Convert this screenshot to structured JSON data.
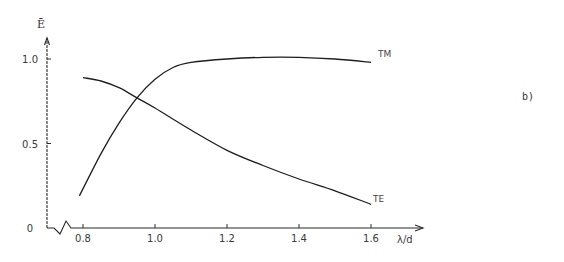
{
  "chart_data": {
    "type": "line",
    "title": "",
    "panel_label": "b)",
    "xlabel": "λ/d",
    "ylabel": "Ē",
    "xlim": [
      0.8,
      1.6
    ],
    "ylim": [
      0,
      1.0
    ],
    "x_axis_break": true,
    "grid": false,
    "x_ticks": [
      0.8,
      1.0,
      1.2,
      1.4,
      1.6
    ],
    "x_tick_labels": [
      "0.8",
      "1.0",
      "1.2",
      "1.4",
      "1.6"
    ],
    "y_ticks": [
      0,
      0.5,
      1.0
    ],
    "y_tick_labels": [
      "0",
      "0.5",
      "1.0"
    ],
    "series": [
      {
        "name": "TM",
        "label": "TM",
        "x": [
          0.79,
          0.85,
          0.9,
          0.95,
          1.0,
          1.05,
          1.1,
          1.2,
          1.3,
          1.4,
          1.5,
          1.6
        ],
        "y": [
          0.19,
          0.44,
          0.62,
          0.77,
          0.88,
          0.95,
          0.98,
          1.0,
          1.01,
          1.01,
          1.0,
          0.98
        ]
      },
      {
        "name": "TE",
        "label": "TE",
        "x": [
          0.8,
          0.85,
          0.9,
          0.95,
          1.0,
          1.1,
          1.2,
          1.3,
          1.4,
          1.5,
          1.6
        ],
        "y": [
          0.89,
          0.87,
          0.83,
          0.77,
          0.71,
          0.58,
          0.46,
          0.37,
          0.29,
          0.22,
          0.14
        ]
      }
    ]
  }
}
